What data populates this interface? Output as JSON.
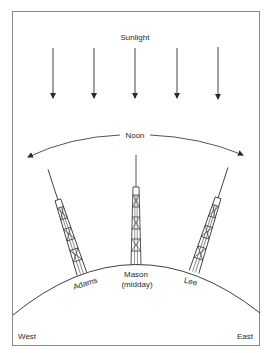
{
  "diagram": {
    "title": "Sunlight",
    "arc_label": "Noon",
    "towers": [
      {
        "name": "Adams",
        "position": "west",
        "tilt_deg": -18
      },
      {
        "name": "Mason",
        "subtitle": "(midday)",
        "position": "center",
        "tilt_deg": 0
      },
      {
        "name": "Lee",
        "position": "east",
        "tilt_deg": 18
      }
    ],
    "directions": {
      "left": "West",
      "right": "East"
    },
    "sunlight_arrow_count": 5,
    "colors": {
      "line": "#2a2a2a",
      "frame": "#888888",
      "background": "#ffffff"
    }
  }
}
